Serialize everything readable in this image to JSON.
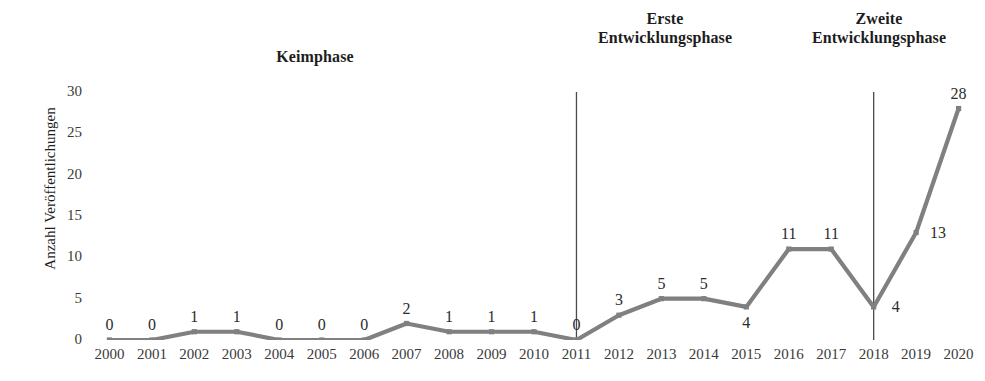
{
  "chart_data": {
    "type": "line",
    "title": "",
    "xlabel": "",
    "ylabel": "Anzahl Veröffentlichungen",
    "ylim": [
      0,
      30
    ],
    "y_ticks": [
      0,
      5,
      10,
      15,
      20,
      25,
      30
    ],
    "grid": false,
    "legend": "none",
    "line_color": "#808080",
    "categories": [
      "2000",
      "2001",
      "2002",
      "2003",
      "2004",
      "2005",
      "2006",
      "2007",
      "2008",
      "2009",
      "2010",
      "2011",
      "2012",
      "2013",
      "2014",
      "2015",
      "2016",
      "2017",
      "2018",
      "2019",
      "2020"
    ],
    "values": [
      0,
      0,
      1,
      1,
      0,
      0,
      0,
      2,
      1,
      1,
      1,
      0,
      3,
      5,
      5,
      4,
      11,
      11,
      4,
      13,
      28
    ],
    "point_labels": [
      "0",
      "0",
      "1",
      "1",
      "0",
      "0",
      "0",
      "2",
      "1",
      "1",
      "1",
      "0",
      "3",
      "5",
      "5",
      "4",
      "11",
      "11",
      "4",
      "13",
      "28"
    ],
    "label_positions": [
      "above",
      "above",
      "above",
      "above",
      "above",
      "above",
      "above",
      "above",
      "above",
      "above",
      "above",
      "above",
      "above",
      "above",
      "above",
      "below",
      "above",
      "above",
      "right",
      "right",
      "above"
    ],
    "annotations": [
      {
        "name": "keimphase",
        "text": "Keimphase"
      },
      {
        "name": "erste-entwicklungsphase",
        "text": "Erste\nEntwicklungsphase"
      },
      {
        "name": "zweite-entwicklungsphase",
        "text": "Zweite\nEntwicklungsphase"
      }
    ],
    "dividers": [
      {
        "name": "divider-2011",
        "at_category": "2011"
      },
      {
        "name": "divider-2018",
        "at_category": "2018"
      }
    ]
  },
  "axis": {
    "y_label": "Anzahl Veröffentlichungen",
    "y_ticks": [
      "30",
      "25",
      "20",
      "15",
      "10",
      "5",
      "0"
    ],
    "x_ticks": [
      "2000",
      "2001",
      "2002",
      "2003",
      "2004",
      "2005",
      "2006",
      "2007",
      "2008",
      "2009",
      "2010",
      "2011",
      "2012",
      "2013",
      "2014",
      "2015",
      "2016",
      "2017",
      "2018",
      "2019",
      "2020"
    ]
  },
  "phases": {
    "first": "Keimphase",
    "second_line1": "Erste",
    "second_line2": "Entwicklungsphase",
    "third_line1": "Zweite",
    "third_line2": "Entwicklungsphase"
  },
  "colors": {
    "line": "#808080",
    "divider": "#4a4a4a",
    "text": "#2b2b2b"
  }
}
